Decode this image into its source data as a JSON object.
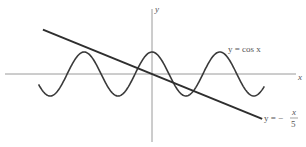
{
  "chart_data": {
    "type": "line",
    "title": "",
    "xlabel": "x",
    "ylabel": "y",
    "grid": false,
    "axes_origin_px": [
      152,
      74
    ],
    "scale_px_per_unit": {
      "x": 10.8,
      "y": 22
    },
    "xlim": [
      -10.5,
      10.4
    ],
    "series": [
      {
        "name": "y = cos x",
        "function": "cos(x)",
        "x_range": [
          -10.5,
          10.4
        ],
        "label": "y = cos x"
      },
      {
        "name": "y = -x/5",
        "function": "-x/5",
        "x_range": [
          -10.1,
          10.2
        ],
        "label": "y = − x/5"
      }
    ]
  },
  "labels": {
    "x_axis": "x",
    "y_axis": "y",
    "cos_label": "y = cos x",
    "line_label_prefix": "y = −",
    "line_label_num": "x",
    "line_label_den": "5"
  },
  "colors": {
    "axis": "#999999",
    "curve": "#3a3a3a",
    "line": "#2e2e2e"
  }
}
